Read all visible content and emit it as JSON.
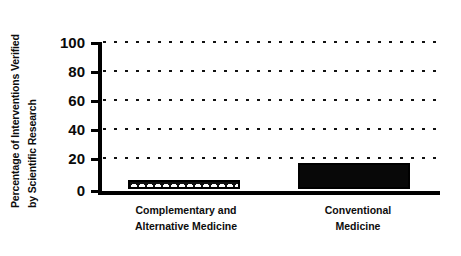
{
  "chart_data": {
    "type": "bar",
    "title": "",
    "xlabel": "",
    "ylabel": "Percentage of Interventions Verified by Scientific Research",
    "ylabel_lines": [
      "Percentage of Interventions Verified",
      "by Scientific Research"
    ],
    "categories": [
      "Complementary and Alternative Medicine",
      "Conventional Medicine"
    ],
    "category_lines": [
      [
        "Complementary and",
        "Alternative Medicine"
      ],
      [
        "Conventional",
        "Medicine"
      ]
    ],
    "values": [
      6,
      18
    ],
    "ylim": [
      0,
      100
    ],
    "yticks": [
      0,
      20,
      40,
      60,
      80,
      100
    ],
    "ytick_labels": [
      "0",
      "20",
      "40",
      "60",
      "80",
      "100"
    ],
    "grid": true,
    "grid_style": "dotted",
    "grid_axis": "y",
    "legend": null,
    "bar_styles": [
      {
        "fill": "hatched-white-arcs-on-black",
        "edge": "#000000"
      },
      {
        "fill": "solid-black",
        "edge": "#000000"
      }
    ],
    "colors": {
      "background": "#ffffff",
      "axis": "#000000",
      "grid": "#111111",
      "bar_0_fill": "#111111",
      "bar_0_pattern": "#ffffff",
      "bar_1_fill": "#080808",
      "text": "#0d0d0d"
    }
  }
}
